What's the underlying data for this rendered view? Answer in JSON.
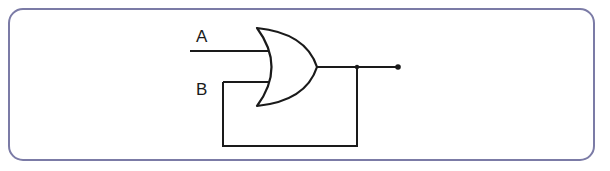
{
  "diagram": {
    "type": "logic-circuit",
    "gate": "OR",
    "inputs": [
      {
        "label": "A"
      },
      {
        "label": "B"
      }
    ],
    "feedback": "output connected back to input B",
    "colors": {
      "frame_border": "#7b7ba6",
      "wire": "#1a1a1a",
      "background": "#ffffff"
    }
  }
}
